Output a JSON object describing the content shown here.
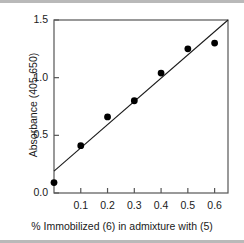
{
  "chart_data": {
    "type": "scatter",
    "title": "",
    "xlabel": "% Immobilized (6) in admixture with (5)",
    "ylabel": "Absorbance (405-650)",
    "xlim": [
      0.0,
      0.65
    ],
    "ylim": [
      0.0,
      1.5
    ],
    "grid": false,
    "legend": null,
    "x_ticks": [
      0.1,
      0.2,
      0.3,
      0.4,
      0.5,
      0.6
    ],
    "x_tick_labels": [
      "0.1",
      "0.2",
      "0.3",
      "0.4",
      "0.5",
      "0.6"
    ],
    "y_ticks": [
      0.0,
      0.5,
      1.0,
      1.5
    ],
    "y_tick_labels": [
      "0.0",
      "0.5",
      "1.0",
      "1.5"
    ],
    "marker_color": "#000000",
    "line_color": "#1a1a1a",
    "axis_color": "#555555",
    "series": [
      {
        "name": "Absorbance measurements",
        "type": "scatter",
        "x": [
          0.0,
          0.1,
          0.2,
          0.3,
          0.4,
          0.5,
          0.6
        ],
        "y": [
          0.09,
          0.41,
          0.66,
          0.8,
          1.04,
          1.25,
          1.3
        ]
      },
      {
        "name": "Linear fit",
        "type": "line",
        "x": [
          0.0,
          0.65
        ],
        "y": [
          0.19,
          1.5
        ]
      }
    ]
  },
  "figure": {
    "top_rule": "",
    "bottom_rule": ""
  }
}
